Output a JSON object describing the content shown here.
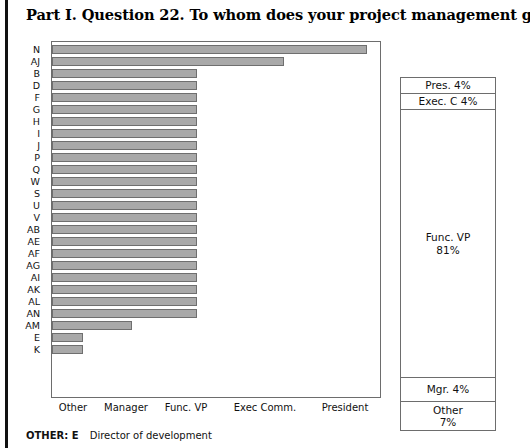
{
  "page": {
    "title": "Part I. Question 22. To whom does your project management group report?",
    "footnote_label": "OTHER: E",
    "footnote_text": "Director of development"
  },
  "chart_data": {
    "type": "bar",
    "orientation": "horizontal",
    "title": "Part I. Question 22. To whom does your project management group report?",
    "xlabel": "",
    "ylabel": "",
    "grid": false,
    "xtick_labels": [
      "Other",
      "Manager",
      "Func. VP",
      "Exec Comm.",
      "President"
    ],
    "xtick_positions": [
      73,
      126,
      186,
      265,
      345
    ],
    "categories": [
      "N",
      "AJ",
      "B",
      "D",
      "F",
      "G",
      "H",
      "I",
      "J",
      "P",
      "Q",
      "W",
      "S",
      "U",
      "V",
      "AB",
      "AE",
      "AF",
      "AG",
      "AI",
      "AK",
      "AL",
      "AN",
      "AM",
      "E",
      "K"
    ],
    "values": [
      4.5,
      3.3,
      2.0,
      2.0,
      2.0,
      2.0,
      2.0,
      2.0,
      2.0,
      2.0,
      2.0,
      2.0,
      2.0,
      2.0,
      2.0,
      2.0,
      2.0,
      2.0,
      2.0,
      2.0,
      2.0,
      2.0,
      2.0,
      1.2,
      0.4,
      0.4
    ],
    "value_unit": "category-scale (1=Other, 2=Manager, 3=Func. VP, 4=Exec Comm., 5=President)",
    "bar_pixel_lengths": [
      315,
      232,
      145,
      145,
      145,
      145,
      145,
      145,
      145,
      145,
      145,
      145,
      145,
      145,
      145,
      145,
      145,
      145,
      145,
      145,
      145,
      145,
      145,
      80,
      31,
      31
    ],
    "bar_color": "#a9a9a9",
    "bar_border_color": "#6f6f6f",
    "legend_position": "right",
    "annotations": [
      {
        "label": "Pres. 4%",
        "share": 4
      },
      {
        "label": "Exec. C 4%",
        "share": 4
      },
      {
        "label": "Func. VP",
        "value": "81%",
        "share": 81
      },
      {
        "label": "Mgr. 4%",
        "share": 4
      },
      {
        "label": "Other",
        "value": "7%",
        "share": 7
      }
    ]
  },
  "legend": {
    "pres": "Pres. 4%",
    "exec": "Exec. C 4%",
    "func_name": "Func. VP",
    "func_value": "81%",
    "mgr": "Mgr. 4%",
    "other_name": "Other",
    "other_value": "7%"
  }
}
